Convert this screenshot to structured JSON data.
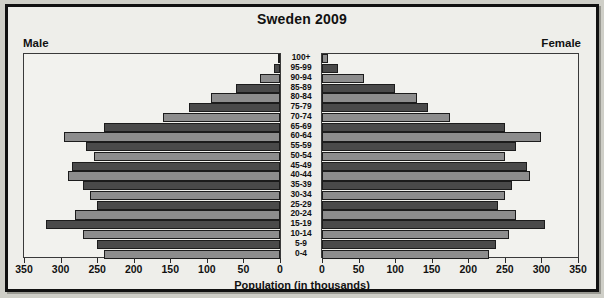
{
  "chart_title": "Sweden 2009",
  "left_label": "Male",
  "right_label": "Female",
  "x_axis_title": "Population (in thousands)",
  "tick_labels_left": [
    "350",
    "300",
    "250",
    "200",
    "150",
    "100",
    "50",
    "0"
  ],
  "tick_labels_right": [
    "0",
    "50",
    "100",
    "150",
    "200",
    "250",
    "300",
    "350"
  ],
  "colors": {
    "bar_dark": "#4a4a4a",
    "bar_light": "#8d8d8d",
    "panel_bg": "#f2f2ee",
    "page_bg": "#eeeeea",
    "border": "#111111",
    "text": "#111111"
  },
  "chart_data": {
    "type": "bar",
    "subtype": "population-pyramid",
    "title": "Sweden 2009",
    "xlabel": "Population (in thousands)",
    "ylabel": "",
    "grid": false,
    "legend": [
      "Male",
      "Female"
    ],
    "legend_position": "top-corners",
    "xlim": [
      0,
      350
    ],
    "x_ticks": [
      0,
      50,
      100,
      150,
      200,
      250,
      300,
      350
    ],
    "categories": [
      "100+",
      "95-99",
      "90-94",
      "85-89",
      "80-84",
      "75-79",
      "70-74",
      "65-69",
      "60-64",
      "55-59",
      "50-54",
      "45-49",
      "40-44",
      "35-39",
      "30-34",
      "25-29",
      "20-24",
      "15-19",
      "10-14",
      "5-9",
      "0-4"
    ],
    "series": [
      {
        "name": "Male",
        "side": "left",
        "values": [
          2,
          8,
          28,
          60,
          95,
          125,
          160,
          240,
          295,
          265,
          255,
          285,
          290,
          270,
          260,
          250,
          280,
          320,
          270,
          250,
          240
        ]
      },
      {
        "name": "Female",
        "side": "right",
        "values": [
          8,
          22,
          58,
          100,
          130,
          145,
          175,
          250,
          300,
          265,
          250,
          280,
          285,
          260,
          250,
          240,
          265,
          305,
          255,
          238,
          228
        ]
      }
    ]
  }
}
